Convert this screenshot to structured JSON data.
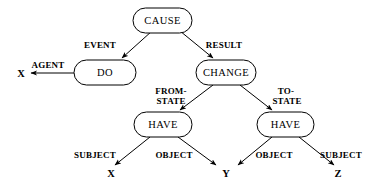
{
  "diagram": {
    "background_color": "#ffffff",
    "stroke_color": "#000000",
    "nodes": [
      {
        "id": "cause",
        "label": "CAUSE",
        "shape": "rounded-rect",
        "x": 162,
        "y": 20,
        "w": 60,
        "h": 25
      },
      {
        "id": "do",
        "label": "DO",
        "shape": "rounded-rect",
        "x": 105,
        "y": 72,
        "w": 62,
        "h": 25
      },
      {
        "id": "change",
        "label": "CHANGE",
        "shape": "rounded-rect",
        "x": 226,
        "y": 72,
        "w": 60,
        "h": 25
      },
      {
        "id": "have-left",
        "label": "HAVE",
        "shape": "rounded-rect",
        "x": 163,
        "y": 124,
        "w": 58,
        "h": 25
      },
      {
        "id": "have-right",
        "label": "HAVE",
        "shape": "rounded-rect",
        "x": 285,
        "y": 124,
        "w": 57,
        "h": 25
      }
    ],
    "leaves": [
      {
        "id": "leaf-x-agent",
        "label": "X",
        "x": 21,
        "y": 76
      },
      {
        "id": "leaf-x-subject",
        "label": "X",
        "x": 111,
        "y": 176
      },
      {
        "id": "leaf-y",
        "label": "Y",
        "x": 226,
        "y": 176
      },
      {
        "id": "leaf-z",
        "label": "Z",
        "x": 338,
        "y": 176
      }
    ],
    "edges": [
      {
        "id": "edge-event",
        "label": "EVENT",
        "from": "cause",
        "to": "do",
        "label_x": 100,
        "label_y": 48
      },
      {
        "id": "edge-result",
        "label": "RESULT",
        "from": "cause",
        "to": "change",
        "label_x": 224,
        "label_y": 48
      },
      {
        "id": "edge-agent",
        "label": "AGENT",
        "from": "do",
        "to": "leaf-x-agent",
        "label_x": 48,
        "label_y": 68
      },
      {
        "id": "edge-from-state",
        "label": "FROM-",
        "label2": "STATE",
        "from": "change",
        "to": "have-left",
        "label_x": 171,
        "label_y": 94
      },
      {
        "id": "edge-to-state",
        "label": "TO-",
        "label2": "STATE",
        "from": "change",
        "to": "have-right",
        "label_x": 287,
        "label_y": 94
      },
      {
        "id": "edge-subject-left",
        "label": "SUBJECT",
        "from": "have-left",
        "to": "leaf-x-subject",
        "label_x": 95,
        "label_y": 158
      },
      {
        "id": "edge-object-left",
        "label": "OBJECT",
        "from": "have-left",
        "to": "leaf-y",
        "label_x": 174,
        "label_y": 158
      },
      {
        "id": "edge-object-right",
        "label": "OBJECT",
        "from": "have-right",
        "to": "leaf-y",
        "label_x": 274,
        "label_y": 158
      },
      {
        "id": "edge-subject-right",
        "label": "SUBJECT",
        "from": "have-right",
        "to": "leaf-z",
        "label_x": 341,
        "label_y": 158
      }
    ]
  }
}
